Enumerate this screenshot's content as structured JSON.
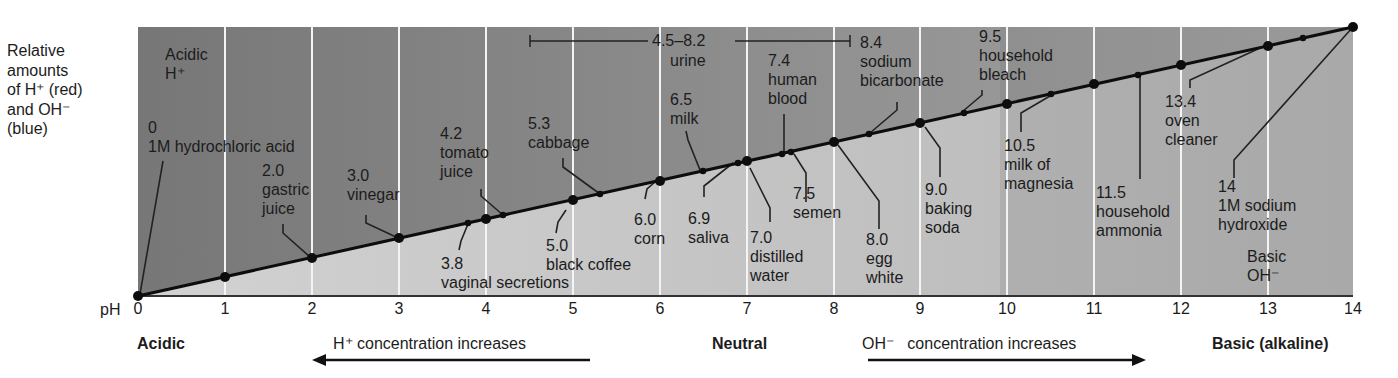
{
  "y_axis_label": [
    "Relative",
    "amounts",
    "of H⁺ (red)",
    "and OH⁻",
    "(blue)"
  ],
  "region_labels": {
    "acidic_top": [
      "Acidic",
      "H⁺"
    ],
    "basic_bottom": [
      "Basic",
      "OH⁻"
    ]
  },
  "axis": {
    "prefix": "pH",
    "ticks": [
      "0",
      "1",
      "2",
      "3",
      "4",
      "5",
      "6",
      "7",
      "8",
      "9",
      "10",
      "11",
      "12",
      "13",
      "14"
    ]
  },
  "bottom_labels": {
    "acidic": "Acidic",
    "neutral": "Neutral",
    "basic": "Basic (alkaline)",
    "h_increase": "H⁺ concentration increases",
    "oh_increase": "OH⁻   concentration increases"
  },
  "urine_range": {
    "label": "4.5–8.2",
    "name": "urine"
  },
  "colors": {
    "acid_region": "#7d7d7d",
    "base_region": "#c2c2c2",
    "gridline": "#f2f2f2",
    "line": "#111111"
  },
  "substances": [
    {
      "ph": "0",
      "name": "1M hydrochloric acid"
    },
    {
      "ph": "2.0",
      "name": "gastric juice"
    },
    {
      "ph": "3.0",
      "name": "vinegar"
    },
    {
      "ph": "3.8",
      "name": "vaginal secretions"
    },
    {
      "ph": "4.2",
      "name": "tomato juice"
    },
    {
      "ph": "5.0",
      "name": "black coffee"
    },
    {
      "ph": "5.3",
      "name": "cabbage"
    },
    {
      "ph": "6.0",
      "name": "corn"
    },
    {
      "ph": "6.5",
      "name": "milk"
    },
    {
      "ph": "6.9",
      "name": "saliva"
    },
    {
      "ph": "7.0",
      "name": "distilled water"
    },
    {
      "ph": "7.4",
      "name": "human blood"
    },
    {
      "ph": "7.5",
      "name": "semen"
    },
    {
      "ph": "8.0",
      "name": "egg white"
    },
    {
      "ph": "8.4",
      "name": "sodium bicarbonate"
    },
    {
      "ph": "9.0",
      "name": "baking soda"
    },
    {
      "ph": "9.5",
      "name": "household bleach"
    },
    {
      "ph": "10.5",
      "name": "milk of magnesia"
    },
    {
      "ph": "11.5",
      "name": "household ammonia"
    },
    {
      "ph": "13.4",
      "name": "oven cleaner"
    },
    {
      "ph": "14",
      "name": "1M sodium hydroxide"
    }
  ],
  "label_lines": {
    "hcl": [
      "0",
      "1M hydrochloric acid"
    ],
    "gastric": [
      "2.0",
      "gastric",
      "juice"
    ],
    "vinegar": [
      "3.0",
      "vinegar"
    ],
    "vaginal": [
      "3.8",
      "vaginal secretions"
    ],
    "tomato": [
      "4.2",
      "tomato",
      "juice"
    ],
    "coffee": [
      "5.0",
      "black coffee"
    ],
    "cabbage": [
      "5.3",
      "cabbage"
    ],
    "corn": [
      "6.0",
      "corn"
    ],
    "milk": [
      "6.5",
      "milk"
    ],
    "saliva": [
      "6.9",
      "saliva"
    ],
    "water": [
      "7.0",
      "distilled",
      "water"
    ],
    "blood": [
      "7.4",
      "human",
      "blood"
    ],
    "semen": [
      "7.5",
      "semen"
    ],
    "egg": [
      "8.0",
      "egg",
      "white"
    ],
    "bicarb": [
      "8.4",
      "sodium",
      "bicarbonate"
    ],
    "baking": [
      "9.0",
      "baking",
      "soda"
    ],
    "bleach": [
      "9.5",
      "household",
      "bleach"
    ],
    "magnesia": [
      "10.5",
      "milk of",
      "magnesia"
    ],
    "ammonia": [
      "11.5",
      "household",
      "ammonia"
    ],
    "oven": [
      "13.4",
      "oven",
      "cleaner"
    ],
    "naoh": [
      "14",
      "1M sodium",
      "hydroxide"
    ]
  }
}
